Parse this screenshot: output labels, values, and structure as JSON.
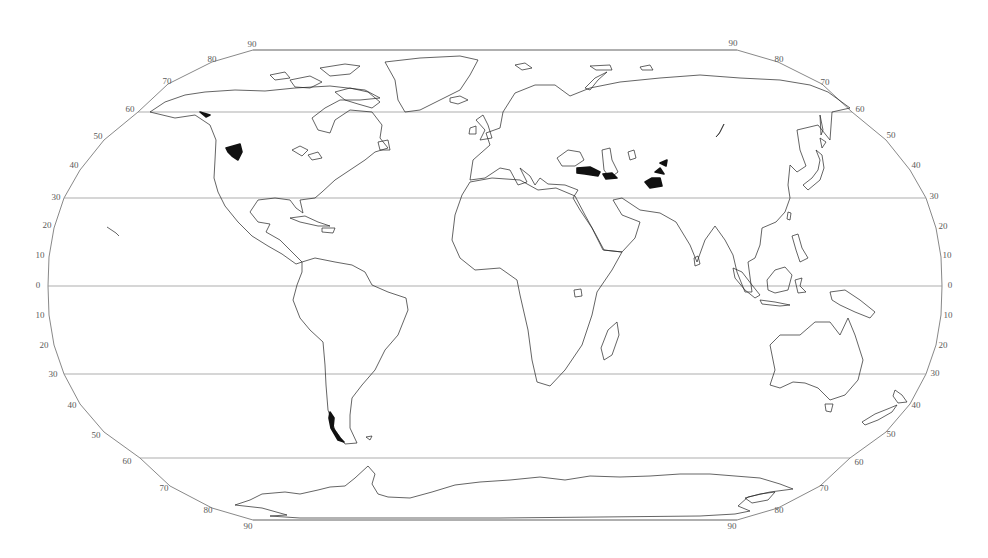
{
  "map": {
    "projection": "robinson",
    "colors": {
      "background": "#ffffff",
      "coastline": "#222222",
      "graticule": "#8a8a8a",
      "highlight": "#111111",
      "label": "#5a5a5a"
    },
    "frame_path": "M253,50 L737,50 L778,62 L822,84 L852,112 L886,140 L910,170 L926,198 L936,228 L941,257 L942,286 L941,315 L936,345 L926,374 L910,404 L886,432 L850,458 L820,486 L778,508 L737,520 L253,520 L212,508 L170,486 L140,458 L104,432 L80,404 L64,374 L54,345 L49,315 L48,286 L49,257 L54,228 L64,198 L80,170 L104,140 L138,112 L168,84 L212,62 Z",
    "latitude_labels": {
      "left": [
        "90",
        "80",
        "70",
        "60",
        "50",
        "40",
        "30",
        "20",
        "10",
        "0",
        "10",
        "20",
        "30",
        "40",
        "50",
        "60",
        "70",
        "80",
        "90"
      ],
      "right": [
        "90",
        "80",
        "70",
        "60",
        "50",
        "40",
        "30",
        "20",
        "10",
        "0",
        "10",
        "20",
        "30",
        "40",
        "50",
        "60",
        "70",
        "80",
        "90"
      ]
    },
    "graticule_latitudes": [
      "60N",
      "30N",
      "0",
      "30S",
      "60S"
    ],
    "landmasses": {
      "north_america": "M150,112 L165,102 L185,95 L205,92 L235,90 L265,91 L295,88 L330,86 L365,90 L380,98 L360,100 L340,100 L325,108 L312,118 L318,130 L330,133 L335,120 L350,110 L372,112 L382,125 L380,138 L388,148 L375,152 L365,160 L350,170 L335,180 L322,192 L315,198 L300,200 L303,213 L296,208 L290,200 L275,198 L258,200 L250,212 L258,222 L270,224 L266,232 L280,240 L290,250 L302,262 L296,264 L282,254 L268,246 L252,236 L238,222 L225,206 L218,192 L214,178 L215,160 L216,140 L210,125 L195,115 L175,118 Z",
      "greenland": "M385,62 L420,58 L460,56 L478,60 L470,75 L460,90 L440,100 L420,110 L405,112 L398,100 L395,80 Z",
      "south_america": "M302,262 L315,258 L335,262 L352,265 L365,272 L372,285 L388,292 L406,298 L408,310 L398,335 L385,350 L375,370 L362,385 L352,398 L350,415 L350,428 L357,443 L345,444 L335,430 L328,410 L326,385 L325,365 L323,342 L310,330 L300,318 L293,300 L297,285 L302,272 Z",
      "africa": "M470,182 L492,178 L520,180 L538,190 L556,188 L575,196 L585,215 L596,235 L604,250 L622,252 L612,270 L597,292 L592,315 L582,345 L565,370 L550,386 L537,382 L532,360 L528,330 L520,295 L517,280 L500,268 L475,270 L460,258 L452,240 L455,215 L462,195 Z",
      "eurasia": "M470,180 L473,160 L490,145 L486,133 L500,128 L503,112 L515,93 L535,85 L555,85 L570,96 L590,88 L620,82 L660,78 L700,75 L740,78 L780,80 L810,85 L828,92 L850,108 L832,112 L830,140 L818,125 L797,130 L800,150 L806,166 L797,172 L790,165 L788,185 L790,198 L785,212 L776,222 L762,228 L760,245 L755,258 L748,262 L752,292 L745,292 L737,272 L733,255 L725,240 L715,226 L705,240 L697,262 L690,245 L676,222 L660,213 L640,210 L622,198 L613,200 L622,215 L640,222 L635,238 L622,252 L603,250 L592,228 L580,210 L573,198 L578,190 L565,185 L548,184 L540,178 L535,185 L530,176 L520,168 L527,182 L518,185 L510,170 L500,168 L485,178 Z",
      "australia": "M770,345 L780,335 L800,335 L815,322 L830,322 L840,335 L848,318 L855,335 L863,360 L858,380 L845,395 L830,400 L818,388 L805,383 L793,382 L780,388 L770,385 L775,370 Z",
      "antarctica": "M235,505 L250,500 L262,494 L285,492 L300,494 L318,490 L330,487 L345,486 L355,478 L368,466 L375,474 L372,484 L378,494 L388,497 L410,498 L432,492 L455,485 L480,482 L510,480 L540,477 L565,480 L590,476 L620,477 L650,476 L680,474 L710,474 L735,476 L760,478 L780,484 L793,489 L770,492 L748,497 L738,506 L750,511 L735,514 L700,516 L600,517 L500,518 L400,518 L300,518 L270,516 L287,515 L262,508 Z"
    },
    "islands": {
      "baffin": "M335,92 L350,88 L368,92 L380,102 L372,108 L358,104 L345,100 Z",
      "victoria": "M290,80 L310,76 L322,82 L310,88 L295,87 Z",
      "ellesmere": "M320,68 L345,64 L360,66 L350,74 L330,76 Z",
      "banks": "M270,75 L285,72 L290,78 L275,80 Z",
      "newfoundland": "M378,142 L388,140 L390,150 L380,150 Z",
      "lake_superior": "M292,150 L300,146 L308,150 L302,156 Z",
      "lake_huron": "M308,155 L318,152 L322,158 L312,160 Z",
      "cuba": "M290,218 L305,216 L318,222 L330,226 L318,226 L300,222 Z",
      "hispaniola": "M322,228 L335,228 L333,233 L322,232 Z",
      "great_britain": "M476,120 L483,115 L488,125 L492,138 L480,140 L485,130 Z",
      "ireland": "M470,128 L476,126 L476,134 L469,134 Z",
      "iceland": "M450,98 L460,96 L468,100 L458,104 L450,102 Z",
      "svalbard": "M515,65 L525,63 L532,68 L522,70 Z",
      "novaya_zemlya": "M585,88 L595,78 L607,72 L598,80 L590,90 Z",
      "franz_josef": "M590,66 L610,65 L612,70 L596,70 Z",
      "severnaya": "M640,67 L650,65 L653,70 L642,70 Z",
      "black_sea": "M557,158 L568,150 L580,152 L584,160 L575,166 L562,166 Z",
      "caspian_sea": "M602,150 L610,148 L612,160 L618,172 L610,178 L604,170 Z",
      "aral_sea": "M628,152 L634,150 L636,158 L630,160 Z",
      "baikal": "M724,124 L720,132 L716,137 L719,134 Z",
      "sri_lanka": "M694,258 L698,256 L700,264 L695,266 Z",
      "taiwan": "M788,212 L791,213 L790,220 L787,219 Z",
      "japan": "M803,185 L812,178 L818,170 L820,160 L816,150 L822,155 L824,168 L820,180 L808,190 Z",
      "hokkaido": "M820,138 L826,142 L822,148 Z",
      "sakhalin": "M820,115 L823,130 L821,135 Z",
      "philippines": "M792,236 L798,234 L802,248 L808,258 L800,262 L796,250 Z",
      "borneo": "M767,280 L775,270 L785,267 L792,275 L788,290 L775,293 L768,290 Z",
      "sumatra": "M733,268 L742,272 L752,285 L760,295 L755,298 L745,290 L735,278 Z",
      "java": "M760,300 L775,302 L790,305 L780,306 L762,304 Z",
      "sulawesi": "M795,280 L802,278 L800,286 L806,292 L798,293 Z",
      "new_guinea": "M830,292 L845,290 L860,300 L875,312 L870,318 L855,312 L840,305 L832,300 Z",
      "tasmania": "M825,404 L833,404 L831,412 L826,411 Z",
      "nz_north": "M895,390 L902,395 L907,402 L898,403 L893,396 Z",
      "nz_south": "M862,422 L875,414 L890,408 L897,405 L892,412 L878,420 L865,425 Z",
      "madagascar": "M608,330 L617,322 L619,335 L612,355 L604,360 L601,348 Z",
      "lake_victoria": "M574,290 L581,289 L582,296 L575,297 Z",
      "hawaii": "M107,227 L110,229 L113,231 L116,233 L119,236",
      "falklands": "M366,437 L372,436 L370,440 Z",
      "ross_ice_shelf": "M745,498 L760,494 L775,492 L768,500 L752,503 Z"
    },
    "highlighted_regions": {
      "rockies": "M226,148 L240,144 L242,152 L238,160 L232,156 L228,152 Z",
      "alaska_range": "M200,112 L210,115 L206,117 Z",
      "anatolia_iran": "M577,168 L590,167 L600,172 L598,176 L585,174 L577,173 Z",
      "zagros": "M603,174 L612,173 L617,178 L606,179 Z",
      "tian_shan_a": "M645,182 L652,178 L660,178 L662,186 L650,188 Z",
      "tian_shan_b": "M655,172 L660,168 L664,174 Z",
      "tian_shan_c": "M660,163 L667,160 L666,166 Z",
      "patagonia_ice": "M330,412 L334,418 L333,428 L340,438 L344,442 L338,440 L331,428 L329,418 Z"
    }
  }
}
